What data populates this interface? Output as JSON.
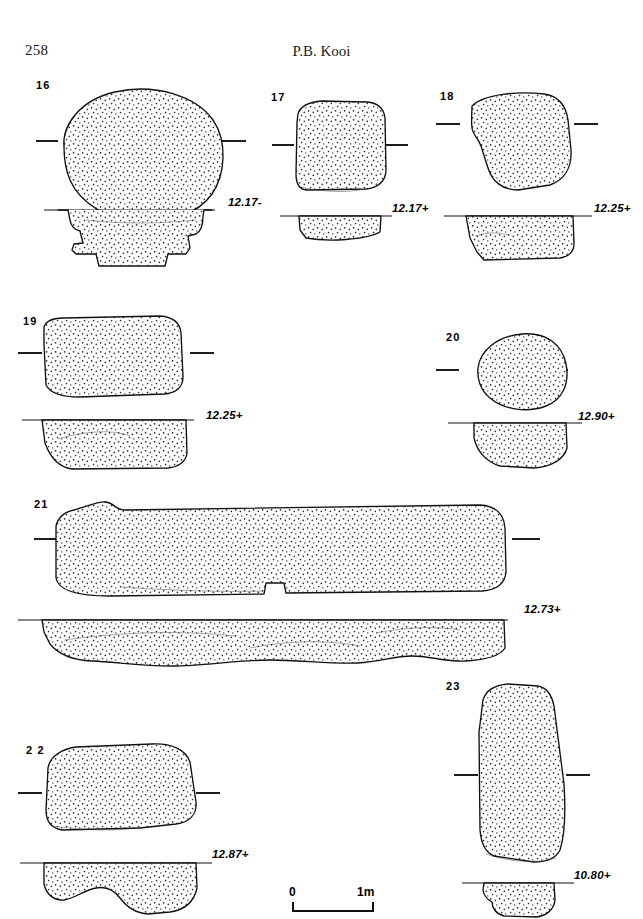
{
  "page": {
    "number": "258",
    "running_head": "P.B. Kooi"
  },
  "scale": {
    "start_label": "0",
    "end_label": "1m"
  },
  "figures": [
    {
      "id": "16",
      "number": "16",
      "elevation": "12.17-",
      "plan_shape": "oval",
      "section_shape": "stepped-shouldered"
    },
    {
      "id": "17",
      "number": "17",
      "elevation": "12.17+",
      "plan_shape": "rounded-square",
      "section_shape": "shallow-basin"
    },
    {
      "id": "18",
      "number": "18",
      "elevation": "12.25+",
      "plan_shape": "irregular-rounded",
      "section_shape": "flat-bottom"
    },
    {
      "id": "19",
      "number": "19",
      "elevation": "12.25+",
      "plan_shape": "rounded-rectangle",
      "section_shape": "broad-basin"
    },
    {
      "id": "20",
      "number": "20",
      "elevation": "12.90+",
      "plan_shape": "round",
      "section_shape": "deep-basin"
    },
    {
      "id": "21",
      "number": "21",
      "elevation": "12.73+",
      "plan_shape": "elongated-bar",
      "section_shape": "long-shallow-trough"
    },
    {
      "id": "22",
      "number": "2 2",
      "elevation": "12.87+",
      "plan_shape": "rounded-rectangle",
      "section_shape": "double-lobed"
    },
    {
      "id": "23",
      "number": "23",
      "elevation": "10.80+",
      "plan_shape": "tall-oval",
      "section_shape": "lobed-basin"
    }
  ]
}
